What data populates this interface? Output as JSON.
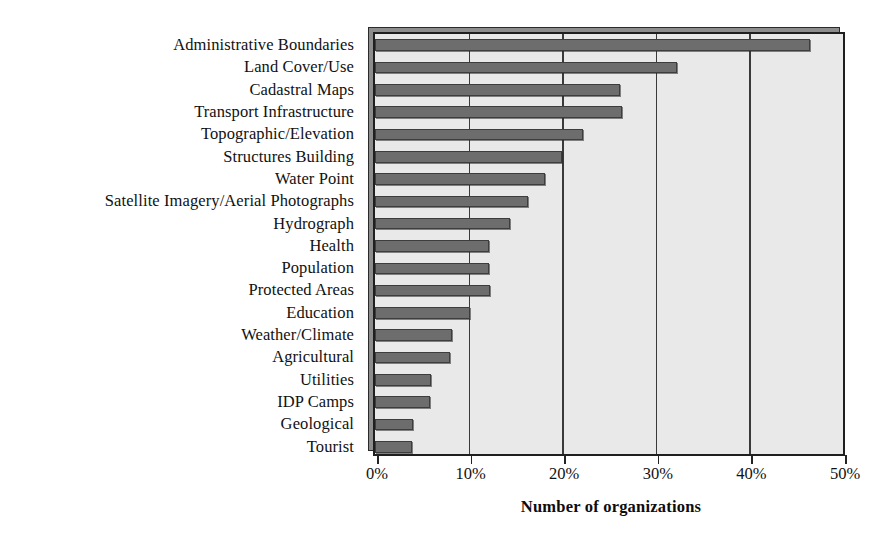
{
  "chart_data": {
    "type": "bar",
    "orientation": "horizontal",
    "title": "",
    "xlabel": "Number of organizations",
    "ylabel": "",
    "xlim": [
      0,
      50
    ],
    "xunit": "%",
    "grid": "vertical",
    "legend": "none",
    "bar_color": "#6d6d6d",
    "plot_background": "#e9e9e9",
    "tick_labels": [
      "0%",
      "10%",
      "20%",
      "30%",
      "40%",
      "50%"
    ],
    "tick_values": [
      0,
      10,
      20,
      30,
      40,
      50
    ],
    "categories": [
      "Administrative Boundaries",
      "Land Cover/Use",
      "Cadastral Maps",
      "Transport Infrastructure",
      "Topographic/Elevation",
      "Structures Building",
      "Water Point",
      "Satellite Imagery/Aerial Photographs",
      "Hydrograph",
      "Health",
      "Population",
      "Protected Areas",
      "Education",
      "Weather/Climate",
      "Agricultural",
      "Utilities",
      "IDP Camps",
      "Geological",
      "Tourist"
    ],
    "values": [
      46.5,
      32.3,
      26.2,
      26.4,
      22.2,
      20.0,
      18.2,
      16.3,
      14.4,
      12.2,
      12.2,
      12.3,
      10.1,
      8.2,
      8.0,
      6.0,
      5.9,
      4.1,
      4.0
    ]
  }
}
